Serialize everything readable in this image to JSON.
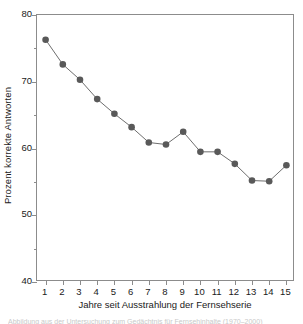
{
  "chart_data": {
    "type": "line",
    "title": "",
    "subtitle": "",
    "xlabel": "Jahre seit Ausstrahlung der Fernsehserie",
    "ylabel": "Prozent korrekte Antworten",
    "x": [
      1,
      2,
      3,
      4,
      5,
      6,
      7,
      8,
      9,
      10,
      11,
      12,
      13,
      14,
      15
    ],
    "values": [
      76.3,
      72.6,
      70.3,
      67.4,
      65.2,
      63.2,
      60.9,
      60.6,
      62.5,
      59.5,
      59.5,
      57.7,
      55.2,
      55.1,
      57.5
    ],
    "series": [
      {
        "name": "Prozent korrekte Antworten",
        "values": [
          76.3,
          72.6,
          70.3,
          67.4,
          65.2,
          63.2,
          60.9,
          60.6,
          62.5,
          59.5,
          59.5,
          57.7,
          55.2,
          55.1,
          57.5
        ]
      }
    ],
    "xlim": [
      0.5,
      15.5
    ],
    "ylim": [
      40,
      80
    ],
    "y_ticks": [
      40,
      50,
      60,
      70,
      80
    ],
    "y_minor_ticks": [
      45,
      55,
      65,
      75
    ],
    "x_ticks": [
      1,
      2,
      3,
      4,
      5,
      6,
      7,
      8,
      9,
      10,
      11,
      12,
      13,
      14,
      15
    ],
    "y_tick_labels": [
      "40",
      "50",
      "60",
      "70",
      "80"
    ],
    "x_tick_labels": [
      "1",
      "2",
      "3",
      "4",
      "5",
      "6",
      "7",
      "8",
      "9",
      "10",
      "11",
      "12",
      "13",
      "14",
      "15"
    ],
    "grid": false,
    "legend": null,
    "legend_position": "none",
    "marker": "circle",
    "annotations": []
  },
  "style": {
    "marker_color": "#595959",
    "line_color": "#6e6e6e",
    "axis_color": "#8c8c8c",
    "text_color": "#1a1a1a",
    "background": "#ffffff"
  },
  "caption": {
    "sliver_text": "Abbildung aus der Untersuchung zum Gedächtnis für Fernsehinhalte (1970–2000)"
  }
}
